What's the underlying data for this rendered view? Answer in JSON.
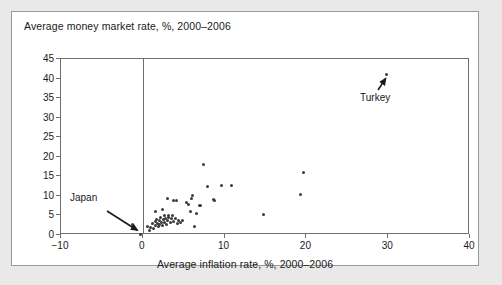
{
  "chart_data": {
    "type": "scatter",
    "title": "Average money market rate, %, 2000–2006",
    "xlabel": "Average inflation rate, %, 2000–2006",
    "ylabel": "Average money market rate, %, 2000–2006",
    "xlim": [
      -10,
      40
    ],
    "ylim": [
      0,
      45
    ],
    "xticks": [
      -10,
      0,
      10,
      20,
      30,
      40
    ],
    "yticks": [
      0,
      5,
      10,
      15,
      20,
      25,
      30,
      35,
      40,
      45
    ],
    "xtick_labels": [
      "−10",
      "0",
      "10",
      "20",
      "30",
      "40"
    ],
    "ytick_labels": [
      "0",
      "5",
      "10",
      "15",
      "20",
      "25",
      "30",
      "35",
      "40",
      "45"
    ],
    "grid": false,
    "legend": null,
    "zero_reference_line_x": 0,
    "points": [
      {
        "x": -0.3,
        "y": 0.2
      },
      {
        "x": -1.2,
        "y": 2.6
      },
      {
        "x": 0.6,
        "y": 2.3
      },
      {
        "x": 0.8,
        "y": 1.2
      },
      {
        "x": 1.0,
        "y": 2.0
      },
      {
        "x": 1.2,
        "y": 2.9
      },
      {
        "x": 1.3,
        "y": 1.6
      },
      {
        "x": 1.5,
        "y": 3.4
      },
      {
        "x": 1.6,
        "y": 2.4
      },
      {
        "x": 1.7,
        "y": 4.0
      },
      {
        "x": 1.8,
        "y": 3.0
      },
      {
        "x": 1.9,
        "y": 2.2
      },
      {
        "x": 2.0,
        "y": 3.6
      },
      {
        "x": 2.1,
        "y": 2.7
      },
      {
        "x": 2.2,
        "y": 4.4
      },
      {
        "x": 2.3,
        "y": 3.2
      },
      {
        "x": 2.4,
        "y": 2.5
      },
      {
        "x": 2.5,
        "y": 3.9
      },
      {
        "x": 2.6,
        "y": 4.9
      },
      {
        "x": 2.7,
        "y": 3.1
      },
      {
        "x": 2.8,
        "y": 4.2
      },
      {
        "x": 2.9,
        "y": 2.8
      },
      {
        "x": 3.0,
        "y": 3.7
      },
      {
        "x": 3.1,
        "y": 5.1
      },
      {
        "x": 3.2,
        "y": 4.6
      },
      {
        "x": 3.4,
        "y": 3.3
      },
      {
        "x": 3.5,
        "y": 4.1
      },
      {
        "x": 3.6,
        "y": 5.0
      },
      {
        "x": 3.8,
        "y": 3.5
      },
      {
        "x": 4.0,
        "y": 4.3
      },
      {
        "x": 4.2,
        "y": 3.0
      },
      {
        "x": 4.4,
        "y": 3.8
      },
      {
        "x": 4.6,
        "y": 3.2
      },
      {
        "x": 4.8,
        "y": 3.6
      },
      {
        "x": 1.6,
        "y": 5.9
      },
      {
        "x": 2.4,
        "y": 6.4
      },
      {
        "x": 3.0,
        "y": 9.4
      },
      {
        "x": 3.7,
        "y": 8.9
      },
      {
        "x": 4.1,
        "y": 8.8
      },
      {
        "x": 5.3,
        "y": 8.3
      },
      {
        "x": 5.6,
        "y": 7.9
      },
      {
        "x": 5.8,
        "y": 5.9
      },
      {
        "x": 5.9,
        "y": 9.3
      },
      {
        "x": 6.1,
        "y": 10.1
      },
      {
        "x": 6.3,
        "y": 2.3
      },
      {
        "x": 6.6,
        "y": 5.6
      },
      {
        "x": 6.9,
        "y": 7.6
      },
      {
        "x": 7.1,
        "y": 7.5
      },
      {
        "x": 7.4,
        "y": 18.0
      },
      {
        "x": 7.9,
        "y": 12.5
      },
      {
        "x": 8.6,
        "y": 9.2
      },
      {
        "x": 8.8,
        "y": 8.9
      },
      {
        "x": 9.6,
        "y": 12.6
      },
      {
        "x": 10.8,
        "y": 12.6
      },
      {
        "x": 14.8,
        "y": 5.2
      },
      {
        "x": 19.6,
        "y": 16.0
      },
      {
        "x": 19.3,
        "y": 10.4
      },
      {
        "x": 29.8,
        "y": 41.0
      }
    ],
    "annotations": [
      {
        "label": "Japan",
        "point_x": -0.3,
        "point_y": 0.2
      },
      {
        "label": "Turkey",
        "point_x": 29.8,
        "point_y": 41.0
      }
    ]
  }
}
